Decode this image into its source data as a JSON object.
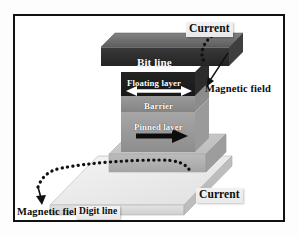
{
  "figure": {
    "background_color": "#ffffff",
    "border_color": "#111111"
  },
  "labels": {
    "bit_line": "Bit line",
    "floating_layer": "Floating layer",
    "barrier": "Barrier",
    "pinned_layer": "Pinned layer",
    "digit_line": "Digit line",
    "current_top": "Current",
    "current_bottom": "Current",
    "magnetic_field_top": "Magnetic field",
    "magnetic_field_bottom": "Magnetic field"
  },
  "structures": {
    "bit_line": {
      "name": "bit-line-slab",
      "fill_top": "#6e6e6e",
      "fill_front": "#2b2b2b",
      "fill_side": "#3d3d3d"
    },
    "floating_layer": {
      "name": "floating-layer-slab",
      "fill_front": "#1e1e1e",
      "fill_side": "#2e2e2e"
    },
    "barrier": {
      "name": "barrier-slab",
      "fill_front": "#8f8f8f",
      "fill_side": "#a0a0a0"
    },
    "pinned_layer": {
      "name": "pinned-layer-slab",
      "fill_front": "#9b9b9b",
      "fill_side": "#adadad"
    },
    "base_pedestal": {
      "name": "base-pedestal-slab",
      "fill_top": "#c6c6c6",
      "fill_front": "#b2b2b2",
      "fill_side": "#9d9d9d"
    },
    "digit_line": {
      "name": "digit-line-slab",
      "fill_top": "#ededed",
      "fill_front": "#dcdcdc",
      "fill_side": "#bdbdbd"
    }
  },
  "arrows": {
    "floating_layer_magnetization": {
      "name": "floating-layer-double-arrow",
      "direction": "bidirectional",
      "color": "#ffffff"
    },
    "pinned_layer_magnetization": {
      "name": "pinned-layer-arrow",
      "direction": "right",
      "color": "#0d0d0d"
    },
    "current_path_top": {
      "name": "current-dotted-path-top",
      "style": "dotted",
      "color": "#111111"
    },
    "current_path_bottom": {
      "name": "current-dotted-path-bottom",
      "style": "dotted",
      "color": "#111111"
    },
    "magnetic_field_pointer_top": {
      "name": "magnetic-field-leader-top",
      "style": "solid-arrow",
      "color": "#111111"
    },
    "magnetic_field_pointer_bottom": {
      "name": "magnetic-field-leader-bottom",
      "style": "solid-arrow",
      "color": "#111111"
    }
  }
}
